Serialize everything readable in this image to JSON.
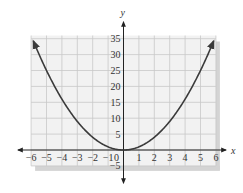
{
  "chart_data": {
    "type": "line",
    "title": "",
    "xlabel": "x",
    "ylabel": "y",
    "function": "y = x^2",
    "x": [
      -6,
      -5,
      -4,
      -3,
      -2,
      -1,
      0,
      1,
      2,
      3,
      4,
      5,
      6
    ],
    "series": [
      {
        "name": "y = x^2",
        "values": [
          36,
          25,
          16,
          9,
          4,
          1,
          0,
          1,
          4,
          9,
          16,
          25,
          36
        ]
      }
    ],
    "xlim": [
      -6,
      6
    ],
    "ylim": [
      -5,
      35
    ],
    "x_ticks": [
      "-6",
      "-5",
      "-4",
      "-3",
      "-2",
      "-1",
      "0",
      "1",
      "2",
      "3",
      "4",
      "5",
      "6"
    ],
    "y_ticks": [
      "-5",
      "5",
      "10",
      "15",
      "20",
      "25",
      "30",
      "35"
    ],
    "grid": true,
    "legend": "none",
    "curve_endpoints_arrows": true,
    "colors": {
      "curve": "#3a3a3a",
      "grid": "#c8c8c8",
      "background": "#f2f2f2",
      "shadow": "#d4d4d4",
      "axis": "#222222"
    }
  }
}
